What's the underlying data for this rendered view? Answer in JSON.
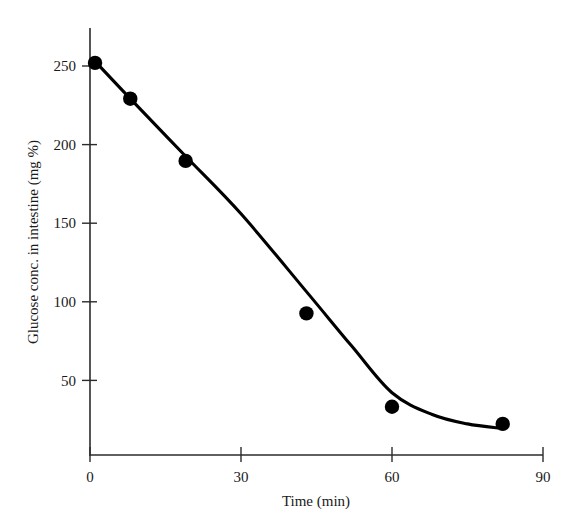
{
  "chart_data": {
    "type": "scatter",
    "title": "",
    "subtitle": "",
    "xlabel": "Time (min)",
    "ylabel": "Glucose conc. in intestine (mg %)",
    "xlim": [
      0,
      90
    ],
    "ylim": [
      0,
      265
    ],
    "grid": false,
    "legend": "none",
    "x_ticks": [
      0,
      30,
      60,
      90
    ],
    "x_tick_labels": [
      "0",
      "30",
      "60",
      "90"
    ],
    "y_ticks": [
      50,
      100,
      150,
      200,
      250
    ],
    "y_tick_labels": [
      "50",
      "100",
      "150",
      "200",
      "250"
    ],
    "series": [
      {
        "name": "Glucose concentration",
        "marker": "filled-circle",
        "color": "#000000",
        "x": [
          1,
          8,
          19,
          43,
          60,
          82
        ],
        "y": [
          252,
          229,
          189,
          91,
          31,
          20
        ]
      }
    ],
    "fitted_curve": {
      "name": "fitted trend line",
      "color": "#000000",
      "x": [
        1,
        8,
        19,
        30,
        43,
        52,
        60,
        68,
        75,
        82
      ],
      "y": [
        253,
        229,
        192,
        155,
        105,
        70,
        40,
        26,
        20,
        17
      ]
    },
    "annotations": []
  },
  "axis_titles": {
    "x": "Time (min)",
    "y": "Glucose conc. in intestine (mg %)"
  }
}
